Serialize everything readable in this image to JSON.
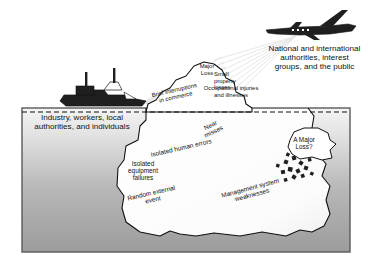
{
  "diagram": {
    "external_labels": [
      {
        "name": "industry",
        "text": "Industry, workers, local\nauthorities, and individuals"
      },
      {
        "name": "authorities",
        "text": "National and international\nauthorities, interest\ngroups, and the public"
      }
    ],
    "tip_labels": [
      {
        "name": "major-loss",
        "text": "Major\nLoss"
      },
      {
        "name": "small-property-losses",
        "text": "Small\nproperty\nlosses"
      },
      {
        "name": "occupational",
        "text": "Occupational injuries\nand illnesses"
      },
      {
        "name": "brief-interruptions",
        "text": "Brief interruptions\nin commerce"
      }
    ],
    "submerged_labels": [
      {
        "name": "near-misses",
        "text": "Near\nmisses"
      },
      {
        "name": "isolated-human-errors",
        "text": "Isolated human errors"
      },
      {
        "name": "isolated-equipment-failures",
        "text": "Isolated\nequipment\nfailures"
      },
      {
        "name": "random-external-event",
        "text": "Random external\nevent"
      },
      {
        "name": "management-system-weaknesses",
        "text": "Management system\nweaknesses"
      }
    ],
    "thought_bubble": {
      "name": "a-major-loss",
      "text": "A Major\nLoss?"
    },
    "icons": [
      {
        "name": "ship-icon",
        "label": "ship"
      },
      {
        "name": "airplane-icon",
        "label": "airplane"
      },
      {
        "name": "rocks-icon",
        "label": "rock cluster"
      },
      {
        "name": "waterline-icon",
        "label": "waterline"
      }
    ],
    "colors": {
      "water_top": "#f2f2f2",
      "water_bottom": "#9a9a9a",
      "iceberg": "#ffffff",
      "outline": "#111111",
      "silhouette": "#1a1a1a",
      "rays": "#d8d8d8",
      "frame": "#5a5a5a"
    }
  }
}
